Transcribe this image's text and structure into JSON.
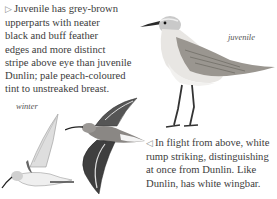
{
  "juvenile_text": {
    "arrow": "▷",
    "lines": [
      "Juvenile has grey-brown",
      "upperparts with neater",
      "black and buff feather",
      "edges and more distinct",
      "stripe above eye than juvenile",
      "Dunlin; pale peach-coloured",
      "tint to unstreaked breast."
    ]
  },
  "flight_text": {
    "arrow": "◁",
    "lines": [
      "In flight from above, white",
      "rump striking, distinguishing",
      "at once from Dunlin. Like",
      "Dunlin, has white wingbar."
    ]
  },
  "captions": {
    "juvenile": "juvenile",
    "winter": "winter"
  },
  "illustrations": {
    "standing_bird": "curlew-sandpiper-juvenile-standing",
    "flying_underside": "curlew-sandpiper-winter-flight-below",
    "flying_upperside": "curlew-sandpiper-flight-above"
  }
}
